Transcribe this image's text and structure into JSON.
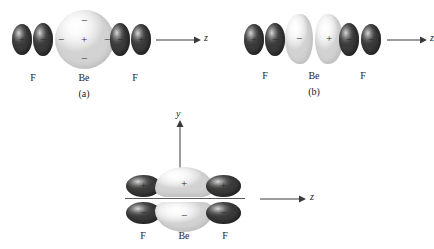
{
  "figure": {
    "panels": [
      {
        "id": "a",
        "caption": "(a)",
        "axis": {
          "label": "z",
          "name": "z-axis"
        },
        "atoms": [
          {
            "symbol": "F",
            "name": "fluorine-left"
          },
          {
            "symbol": "Be",
            "name": "beryllium-center"
          },
          {
            "symbol": "F",
            "name": "fluorine-right"
          }
        ],
        "orbitals": [
          {
            "name": "f-left-outer-lobe",
            "sign": "+",
            "shade": "dark"
          },
          {
            "name": "f-left-inner-lobe",
            "sign": "−",
            "shade": "dark"
          },
          {
            "name": "be-s-orbital",
            "sign": "+",
            "shade": "light"
          },
          {
            "name": "be-s-node-top",
            "sign": "−",
            "shade": "light"
          },
          {
            "name": "be-s-node-bottom",
            "sign": "−",
            "shade": "light"
          },
          {
            "name": "be-s-node-left",
            "sign": "−",
            "shade": "light"
          },
          {
            "name": "be-s-node-right",
            "sign": "−",
            "shade": "light"
          },
          {
            "name": "f-right-inner-lobe",
            "sign": "−",
            "shade": "dark"
          },
          {
            "name": "f-right-outer-lobe",
            "sign": "+",
            "shade": "dark"
          }
        ]
      },
      {
        "id": "b",
        "caption": "(b)",
        "axis": {
          "label": "z",
          "name": "z-axis"
        },
        "atoms": [
          {
            "symbol": "F",
            "name": "fluorine-left"
          },
          {
            "symbol": "Be",
            "name": "beryllium-center"
          },
          {
            "symbol": "F",
            "name": "fluorine-right"
          }
        ],
        "orbitals": [
          {
            "name": "f-left-outer-lobe",
            "sign": "+",
            "shade": "dark"
          },
          {
            "name": "f-left-inner-lobe",
            "sign": "−",
            "shade": "dark"
          },
          {
            "name": "be-p-left-lobe",
            "sign": "−",
            "shade": "light"
          },
          {
            "name": "be-p-right-lobe",
            "sign": "+",
            "shade": "light"
          },
          {
            "name": "f-right-inner-lobe",
            "sign": "−",
            "shade": "dark"
          },
          {
            "name": "f-right-outer-lobe",
            "sign": "−",
            "shade": "dark"
          }
        ]
      },
      {
        "id": "c",
        "caption": "",
        "axis": {
          "label": "z",
          "name": "z-axis",
          "vertical_label": "y",
          "vertical_name": "y-axis"
        },
        "atoms": [
          {
            "symbol": "F",
            "name": "fluorine-left"
          },
          {
            "symbol": "Be",
            "name": "beryllium-center"
          },
          {
            "symbol": "F",
            "name": "fluorine-right"
          }
        ],
        "orbitals": [
          {
            "name": "f-left-upper-lobe",
            "sign": "+",
            "shade": "dark"
          },
          {
            "name": "be-upper-lobe",
            "sign": "+",
            "shade": "light"
          },
          {
            "name": "f-right-upper-lobe",
            "sign": "+",
            "shade": "dark"
          },
          {
            "name": "f-left-lower-lobe",
            "sign": "−",
            "shade": "dark"
          },
          {
            "name": "be-lower-lobe",
            "sign": "−",
            "shade": "light"
          },
          {
            "name": "f-right-lower-lobe",
            "sign": "−",
            "shade": "dark"
          }
        ]
      }
    ]
  },
  "colors": {
    "background": "#ffffff",
    "ink": "#232323",
    "axis": "#3a3a3a",
    "lobe_dark": "#4a4a4a",
    "lobe_light": "#f0f0f0"
  }
}
